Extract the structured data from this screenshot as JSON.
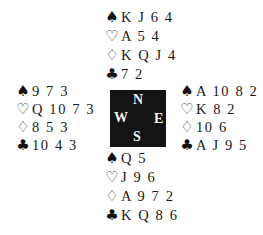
{
  "deal": {
    "suits": [
      {
        "name": "spades",
        "glyph": "♠",
        "style": "filled"
      },
      {
        "name": "hearts",
        "glyph": "♡",
        "style": "outline"
      },
      {
        "name": "diamonds",
        "glyph": "♢",
        "style": "outline"
      },
      {
        "name": "clubs",
        "glyph": "♣",
        "style": "filled"
      }
    ],
    "north": {
      "label": "N",
      "spades": "K J 6 4",
      "hearts": "A 5 4",
      "diamonds": "K Q J 4",
      "clubs": "7 2"
    },
    "west": {
      "label": "W",
      "spades": "9 7 3",
      "hearts": "Q 10 7 3",
      "diamonds": "8 5 3",
      "clubs": "10 4 3"
    },
    "east": {
      "label": "E",
      "spades": "A 10 8 2",
      "hearts": "K 8 2",
      "diamonds": "10 6",
      "clubs": "A J 9 5"
    },
    "south": {
      "label": "S",
      "spades": "Q 5",
      "hearts": "J 9 6",
      "diamonds": "A 9 7 2",
      "clubs": "K Q 8 6"
    }
  },
  "icons": {
    "spade": "♠",
    "heart": "♡",
    "diamond": "♢",
    "club": "♣"
  },
  "colors": {
    "compass_bg": "#141414",
    "compass_text": "#f2f2f2",
    "text": "#1a1a1a",
    "background": "#ffffff"
  }
}
